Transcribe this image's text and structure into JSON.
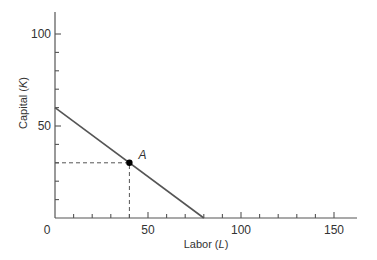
{
  "chart_data": {
    "type": "line",
    "title": "",
    "xlabel": "Labor",
    "xlabel_var": "L",
    "ylabel": "Capital",
    "ylabel_var": "K",
    "xlim": [
      0,
      160
    ],
    "ylim": [
      0,
      110
    ],
    "x_ticks_labeled": [
      0,
      50,
      100,
      150
    ],
    "x_tick_labels": [
      "0",
      "50",
      "100",
      "150"
    ],
    "x_minor_step": 10,
    "y_ticks_labeled": [
      50,
      100
    ],
    "y_tick_labels": [
      "50",
      "100"
    ],
    "y_minor_step": 10,
    "grid": false,
    "series": [
      {
        "name": "isocost line",
        "x": [
          0,
          80
        ],
        "y": [
          60,
          0
        ],
        "color": "#555555"
      }
    ],
    "points": [
      {
        "label": "A",
        "x": 40,
        "y": 30,
        "color": "#000000"
      }
    ],
    "guides": [
      {
        "type": "dashed",
        "from": [
          0,
          30
        ],
        "to": [
          40,
          30
        ]
      },
      {
        "type": "dashed",
        "from": [
          40,
          0
        ],
        "to": [
          40,
          30
        ]
      }
    ],
    "labels": {
      "origin": "0",
      "x_label_text": "Labor (",
      "x_label_var": "L",
      "x_label_close": ")",
      "y_label_text": "Capital (",
      "y_label_var": "K",
      "y_label_close": ")",
      "point_A": "A"
    }
  }
}
